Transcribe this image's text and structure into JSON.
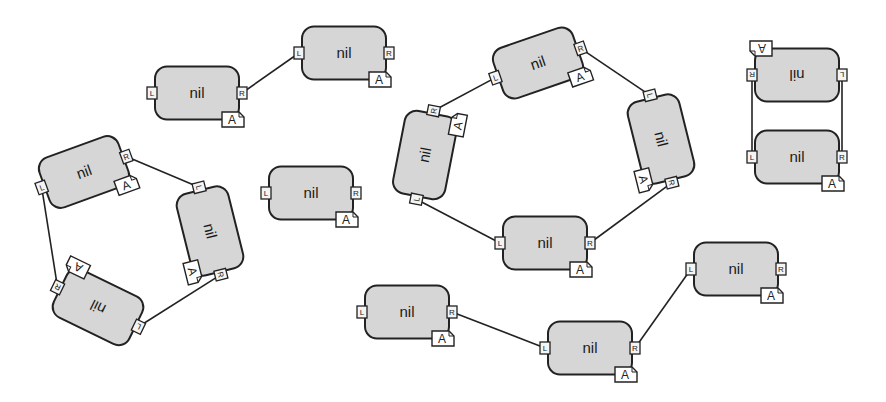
{
  "diagram": {
    "background": "#ffffff",
    "node_fill": "#d6d6d6",
    "stroke": "#222222",
    "port_labels": {
      "left": "L",
      "right": "R"
    },
    "badge_label": "A",
    "nodes": [
      {
        "id": "n1",
        "label": "nil",
        "cx": 197,
        "cy": 93,
        "rot": 0
      },
      {
        "id": "n2",
        "label": "nil",
        "cx": 344,
        "cy": 53,
        "rot": 0
      },
      {
        "id": "t1",
        "label": "nil",
        "cx": 84,
        "cy": 172,
        "rot": -20
      },
      {
        "id": "t2",
        "label": "nil",
        "cx": 210,
        "cy": 231,
        "rot": 76
      },
      {
        "id": "t3",
        "label": "nil",
        "cx": 98,
        "cy": 307,
        "rot": 206
      },
      {
        "id": "iso",
        "label": "nil",
        "cx": 311,
        "cy": 193,
        "rot": 0
      },
      {
        "id": "r1",
        "label": "nil",
        "cx": 538,
        "cy": 63,
        "rot": -19
      },
      {
        "id": "r2",
        "label": "nil",
        "cx": 661,
        "cy": 139,
        "rot": 76
      },
      {
        "id": "r3",
        "label": "nil",
        "cx": 545,
        "cy": 243,
        "rot": 0
      },
      {
        "id": "r4",
        "label": "nil",
        "cx": 425,
        "cy": 155,
        "rot": -79
      },
      {
        "id": "p1",
        "label": "nil",
        "cx": 797,
        "cy": 75,
        "rot": 180
      },
      {
        "id": "p2",
        "label": "nil",
        "cx": 797,
        "cy": 157,
        "rot": 0
      },
      {
        "id": "c1",
        "label": "nil",
        "cx": 407,
        "cy": 312,
        "rot": 0
      },
      {
        "id": "c2",
        "label": "nil",
        "cx": 590,
        "cy": 348,
        "rot": 0
      },
      {
        "id": "c3",
        "label": "nil",
        "cx": 736,
        "cy": 269,
        "rot": 0
      }
    ],
    "edges": [
      {
        "from": "n1",
        "from_port": "R",
        "to": "n2",
        "to_port": "L"
      },
      {
        "from": "t1",
        "from_port": "R",
        "to": "t2",
        "to_port": "L"
      },
      {
        "from": "t2",
        "from_port": "R",
        "to": "t3",
        "to_port": "L"
      },
      {
        "from": "t3",
        "from_port": "R",
        "to": "t1",
        "to_port": "L"
      },
      {
        "from": "r1",
        "from_port": "R",
        "to": "r2",
        "to_port": "L"
      },
      {
        "from": "r2",
        "from_port": "R",
        "to": "r3",
        "to_port": "R"
      },
      {
        "from": "r3",
        "from_port": "L",
        "to": "r4",
        "to_port": "L"
      },
      {
        "from": "r4",
        "from_port": "R",
        "to": "r1",
        "to_port": "L"
      },
      {
        "from": "p1",
        "from_port": "R",
        "to": "p2",
        "to_port": "L"
      },
      {
        "from": "p1",
        "from_port": "L",
        "to": "p2",
        "to_port": "R"
      },
      {
        "from": "c1",
        "from_port": "R",
        "to": "c2",
        "to_port": "L"
      },
      {
        "from": "c2",
        "from_port": "R",
        "to": "c3",
        "to_port": "L"
      }
    ]
  }
}
